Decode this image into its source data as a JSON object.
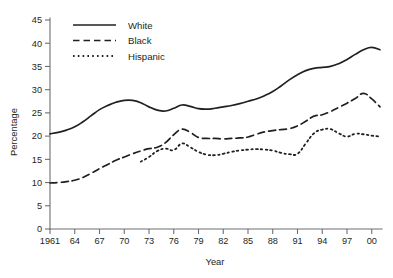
{
  "chart_data": {
    "type": "line",
    "title": "",
    "xlabel": "Year",
    "ylabel": "Percentage",
    "xlim": [
      1961,
      2001
    ],
    "ylim": [
      0,
      45
    ],
    "ytick_step": 5,
    "grid": false,
    "legend_position": "top-left",
    "x_tick_labels": [
      "1961",
      "64",
      "67",
      "70",
      "73",
      "76",
      "79",
      "82",
      "85",
      "88",
      "91",
      "94",
      "97",
      "00"
    ],
    "x_tick_years": [
      1961,
      1964,
      1967,
      1970,
      1973,
      1976,
      1979,
      1982,
      1985,
      1988,
      1991,
      1994,
      1997,
      2000
    ],
    "y_tick_labels": [
      "0",
      "5",
      "10",
      "15",
      "20",
      "25",
      "30",
      "35",
      "40",
      "45"
    ],
    "y_tick_values": [
      0,
      5,
      10,
      15,
      20,
      25,
      30,
      35,
      40,
      45
    ],
    "line_color": "#231f20",
    "axis_color": "#6d6e71",
    "x": [
      1961,
      1962,
      1963,
      1964,
      1965,
      1966,
      1967,
      1968,
      1969,
      1970,
      1971,
      1972,
      1973,
      1974,
      1975,
      1976,
      1977,
      1978,
      1979,
      1980,
      1981,
      1982,
      1983,
      1984,
      1985,
      1986,
      1987,
      1988,
      1989,
      1990,
      1991,
      1992,
      1993,
      1994,
      1995,
      1996,
      1997,
      1998,
      1999,
      2000,
      2001
    ],
    "series": [
      {
        "name": "White",
        "style": "solid",
        "values": [
          20.5,
          20.8,
          21.3,
          22.0,
          23.1,
          24.4,
          25.7,
          26.6,
          27.3,
          27.7,
          27.7,
          27.2,
          26.3,
          25.6,
          25.4,
          26.0,
          26.7,
          26.4,
          25.9,
          25.8,
          26.0,
          26.3,
          26.6,
          27.0,
          27.5,
          28.0,
          28.7,
          29.6,
          30.8,
          32.1,
          33.2,
          34.1,
          34.6,
          34.8,
          35.0,
          35.6,
          36.5,
          37.6,
          38.6,
          39.1,
          38.6
        ]
      },
      {
        "name": "Black",
        "style": "dashed",
        "values": [
          9.9,
          10.0,
          10.2,
          10.5,
          11.1,
          12.0,
          13.0,
          13.9,
          14.8,
          15.5,
          16.2,
          16.8,
          17.3,
          17.6,
          18.6,
          20.3,
          21.5,
          20.8,
          19.7,
          19.5,
          19.5,
          19.4,
          19.5,
          19.6,
          19.8,
          20.4,
          20.9,
          21.2,
          21.4,
          21.6,
          22.2,
          23.2,
          24.3,
          24.6,
          25.3,
          26.2,
          27.1,
          28.1,
          29.2,
          28.0,
          26.3
        ]
      },
      {
        "name": "Hispanic",
        "style": "dotted",
        "values": [
          null,
          null,
          null,
          null,
          null,
          null,
          null,
          null,
          null,
          null,
          null,
          14.5,
          15.5,
          16.8,
          17.3,
          17.0,
          18.4,
          17.6,
          16.6,
          16.0,
          15.9,
          16.2,
          16.6,
          16.9,
          17.1,
          17.2,
          17.1,
          16.9,
          16.4,
          16.1,
          16.2,
          18.4,
          20.6,
          21.4,
          21.5,
          20.6,
          19.9,
          20.5,
          20.4,
          20.1,
          19.9
        ]
      }
    ],
    "legend": [
      {
        "label": "White",
        "style": "solid"
      },
      {
        "label": "Black",
        "style": "dashed"
      },
      {
        "label": "Hispanic",
        "style": "dotted"
      }
    ]
  }
}
